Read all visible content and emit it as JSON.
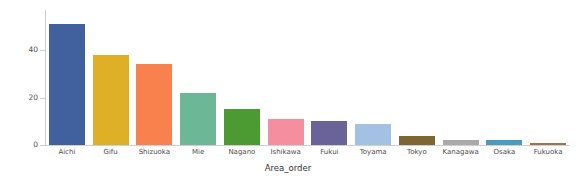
{
  "chart_data": {
    "type": "bar",
    "title": "",
    "xlabel": "Area_order",
    "ylabel": "Count",
    "categories": [
      "Aichi",
      "Gifu",
      "Shizuoka",
      "Mie",
      "Nagano",
      "Ishikawa",
      "Fukui",
      "Toyama",
      "Tokyo",
      "Kanagawa",
      "Osaka",
      "Fukuoka"
    ],
    "values": [
      51,
      38,
      34,
      22,
      15,
      11,
      10,
      9,
      4,
      2,
      2,
      1
    ],
    "colors": [
      "#41619e",
      "#ddb027",
      "#f9814d",
      "#6cb896",
      "#4c9b32",
      "#f58e9e",
      "#6a6399",
      "#a3c2e3",
      "#7f6434",
      "#aaaaaa",
      "#4a9bc4",
      "#a4714b"
    ],
    "ylim": [
      0,
      57
    ],
    "yticks": [
      0,
      20,
      40
    ],
    "ytick_labels": [
      "0",
      "20",
      "40"
    ],
    "grid": false,
    "legend": "none",
    "background": "#ffffff",
    "axis_color": "#cfcfcf"
  }
}
